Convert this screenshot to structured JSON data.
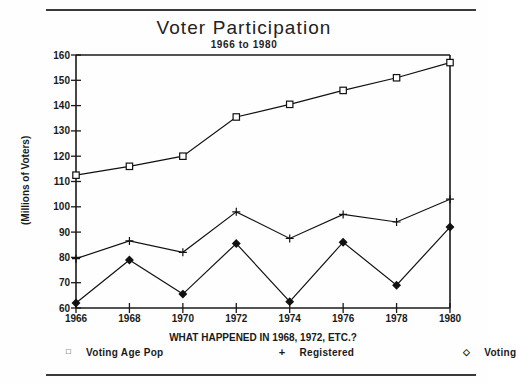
{
  "chart_data": {
    "type": "line",
    "title": "Voter Participation",
    "subtitle": "1966 to 1980",
    "xlabel": "WHAT HAPPENED IN 1968, 1972, ETC.?",
    "ylabel": "(Millions of Voters)",
    "x": [
      1966,
      1968,
      1970,
      1972,
      1974,
      1976,
      1978,
      1980
    ],
    "xtick_labels": [
      "1966",
      "1968",
      "1970",
      "1972",
      "1974",
      "1976",
      "1978",
      "1980"
    ],
    "ytick_labels": [
      "60",
      "70",
      "80",
      "90",
      "100",
      "110",
      "120",
      "130",
      "140",
      "150",
      "160"
    ],
    "yticks": [
      60,
      70,
      80,
      90,
      100,
      110,
      120,
      130,
      140,
      150,
      160
    ],
    "ylim": [
      60,
      160
    ],
    "xlim": [
      1966,
      1980
    ],
    "grid": false,
    "legend_position": "bottom",
    "series": [
      {
        "name": "Voting Age Pop",
        "marker": "square",
        "symbol": "□",
        "values": [
          112.5,
          116,
          120,
          135.5,
          140.5,
          146,
          151,
          157
        ]
      },
      {
        "name": "Registered",
        "marker": "plus",
        "symbol": "+",
        "values": [
          79.5,
          86.5,
          82,
          98,
          87.5,
          97,
          94,
          103
        ]
      },
      {
        "name": "Voting",
        "marker": "diamond",
        "symbol": "◇",
        "values": [
          62,
          79,
          65.5,
          85.5,
          62.5,
          86,
          69,
          92
        ]
      }
    ]
  }
}
